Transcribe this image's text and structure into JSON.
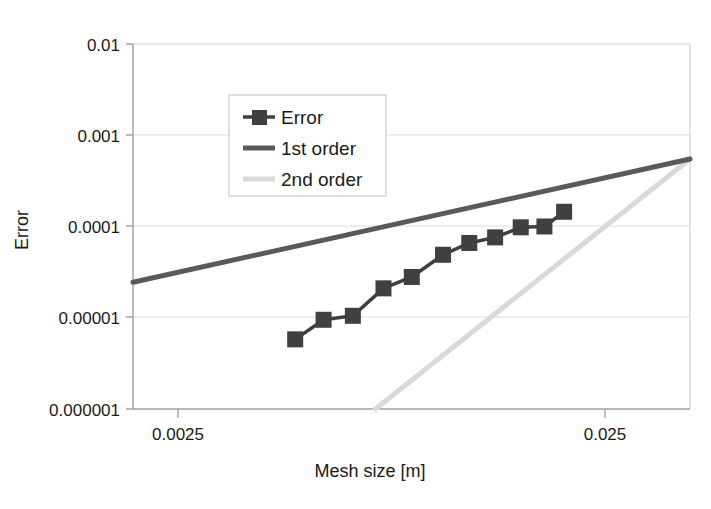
{
  "chart_data": {
    "type": "line",
    "title": "",
    "xlabel": "Mesh size [m]",
    "ylabel": "Error",
    "xscale": "log",
    "yscale": "log",
    "xlim": [
      0.0018,
      0.0425
    ],
    "ylim": [
      1e-06,
      0.01
    ],
    "grid": true,
    "legend_position": "upper-center-left",
    "xticks": [
      {
        "value": 0.0025,
        "label": "0.0025"
      },
      {
        "value": 0.025,
        "label": "0.025"
      }
    ],
    "yticks": [
      {
        "value": 0.01,
        "label": "0.01"
      },
      {
        "value": 0.001,
        "label": "0.001"
      },
      {
        "value": 0.0001,
        "label": "0.0001"
      },
      {
        "value": 1e-05,
        "label": "0.00001"
      },
      {
        "value": 1e-06,
        "label": "0.000001"
      }
    ],
    "series": [
      {
        "name": "Error",
        "type": "line-marker",
        "color": "#404040",
        "marker": "square",
        "x": [
          0.00452,
          0.00531,
          0.00627,
          0.00746,
          0.00876,
          0.01046,
          0.01214,
          0.01406,
          0.01626,
          0.0186,
          0.0208
        ],
        "y": [
          5.8e-06,
          9.5e-06,
          1.05e-05,
          2.1e-05,
          2.8e-05,
          4.9e-05,
          6.6e-05,
          7.6e-05,
          9.8e-05,
          0.0001,
          0.000145
        ]
      },
      {
        "name": "1st order",
        "type": "line",
        "color": "#595959",
        "x": [
          0.0018,
          0.0425
        ],
        "y": [
          2.45e-05,
          0.00055
        ]
      },
      {
        "name": "2nd order",
        "type": "line",
        "color": "#d9d9d9",
        "x": [
          0.00713,
          0.0425
        ],
        "y": [
          1e-06,
          0.00055
        ]
      }
    ]
  },
  "legend": {
    "items": [
      {
        "label": "Error",
        "color": "#404040",
        "symbol": "line-square-marker"
      },
      {
        "label": "1st order",
        "color": "#595959",
        "symbol": "line"
      },
      {
        "label": "2nd order",
        "color": "#d9d9d9",
        "symbol": "line"
      }
    ]
  },
  "colors": {
    "axis": "#a6a6a6",
    "grid": "#d9d9d9",
    "text": "#1a1a1a",
    "background": "#ffffff",
    "legend_border": "#bfbfbf"
  }
}
